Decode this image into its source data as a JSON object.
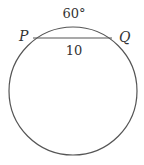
{
  "diagram": {
    "arc_label": "60°",
    "chord_label": "10",
    "point_left": "P",
    "point_right": "Q",
    "colors": {
      "stroke": "#555555",
      "text": "#333333",
      "background": "#ffffff"
    }
  }
}
